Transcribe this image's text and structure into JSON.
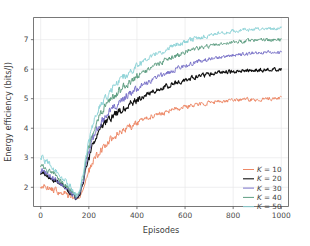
{
  "chart_data": {
    "type": "line",
    "title": "",
    "xlabel": "Episodes",
    "ylabel": "Energy efficiency (bits/J)",
    "xlim": [
      -30,
      1030
    ],
    "ylim": [
      1.35,
      7.75
    ],
    "xticks": [
      0,
      200,
      400,
      600,
      800,
      1000
    ],
    "yticks": [
      2,
      3,
      4,
      5,
      6,
      7
    ],
    "xtick_labels": [
      "0",
      "200",
      "400",
      "600",
      "800",
      "1000"
    ],
    "ytick_labels": [
      "2",
      "3",
      "4",
      "5",
      "6",
      "7"
    ],
    "grid": true,
    "grid_color": "#e8e8ea",
    "legend_position": "lower right",
    "legend_frame": false,
    "noise_amplitude": 0.055,
    "x": [
      0,
      20,
      40,
      60,
      80,
      100,
      120,
      140,
      150,
      160,
      175,
      190,
      200,
      215,
      230,
      250,
      270,
      290,
      310,
      330,
      350,
      375,
      400,
      425,
      450,
      475,
      500,
      525,
      550,
      575,
      600,
      625,
      650,
      675,
      700,
      725,
      750,
      775,
      800,
      850,
      900,
      950,
      1000
    ],
    "series": [
      {
        "name": "K = 10",
        "label_prefix": "K",
        "label_value": "10",
        "color": "#ee8866",
        "linewidth": 1.0,
        "values": [
          2.08,
          2.02,
          1.96,
          1.9,
          1.84,
          1.78,
          1.72,
          1.65,
          1.62,
          1.66,
          1.9,
          2.3,
          2.55,
          2.85,
          3.05,
          3.28,
          3.46,
          3.6,
          3.74,
          3.86,
          3.97,
          4.08,
          4.19,
          4.28,
          4.36,
          4.43,
          4.5,
          4.56,
          4.62,
          4.67,
          4.72,
          4.76,
          4.8,
          4.84,
          4.87,
          4.89,
          4.91,
          4.93,
          4.95,
          4.97,
          4.98,
          4.99,
          5.0
        ]
      },
      {
        "name": "K = 20",
        "label_prefix": "K",
        "label_value": "20",
        "color": "#101010",
        "linewidth": 1.1,
        "values": [
          2.52,
          2.42,
          2.32,
          2.22,
          2.1,
          1.97,
          1.84,
          1.7,
          1.64,
          1.72,
          2.1,
          2.7,
          3.05,
          3.45,
          3.72,
          3.98,
          4.18,
          4.34,
          4.48,
          4.6,
          4.71,
          4.84,
          4.96,
          5.07,
          5.17,
          5.26,
          5.34,
          5.42,
          5.5,
          5.57,
          5.63,
          5.69,
          5.74,
          5.79,
          5.83,
          5.86,
          5.89,
          5.91,
          5.93,
          5.95,
          5.97,
          5.98,
          5.99
        ]
      },
      {
        "name": "K = 30",
        "label_prefix": "K",
        "label_value": "30",
        "color": "#7a73c9",
        "linewidth": 1.0,
        "values": [
          2.6,
          2.5,
          2.4,
          2.28,
          2.15,
          2.01,
          1.87,
          1.72,
          1.66,
          1.76,
          2.18,
          2.82,
          3.2,
          3.62,
          3.92,
          4.2,
          4.42,
          4.6,
          4.76,
          4.9,
          5.02,
          5.18,
          5.32,
          5.45,
          5.57,
          5.68,
          5.78,
          5.87,
          5.96,
          6.04,
          6.11,
          6.18,
          6.24,
          6.29,
          6.34,
          6.38,
          6.41,
          6.44,
          6.47,
          6.51,
          6.54,
          6.56,
          6.57
        ]
      },
      {
        "name": "K = 40",
        "label_prefix": "K",
        "label_value": "40",
        "color": "#5e9e82",
        "linewidth": 1.0,
        "values": [
          2.78,
          2.66,
          2.54,
          2.4,
          2.26,
          2.1,
          1.94,
          1.78,
          1.7,
          1.82,
          2.28,
          2.96,
          3.38,
          3.84,
          4.18,
          4.5,
          4.74,
          4.94,
          5.12,
          5.28,
          5.42,
          5.59,
          5.74,
          5.88,
          6.0,
          6.12,
          6.22,
          6.32,
          6.41,
          6.49,
          6.56,
          6.63,
          6.69,
          6.74,
          6.79,
          6.83,
          6.86,
          6.89,
          6.92,
          6.95,
          6.98,
          7.0,
          7.01
        ]
      },
      {
        "name": "K = 50",
        "label_prefix": "K",
        "label_value": "50",
        "color": "#8fd4d8",
        "linewidth": 1.0,
        "values": [
          3.05,
          2.9,
          2.76,
          2.6,
          2.44,
          2.26,
          2.06,
          1.84,
          1.74,
          1.88,
          2.38,
          3.12,
          3.58,
          4.08,
          4.44,
          4.78,
          5.04,
          5.26,
          5.45,
          5.62,
          5.77,
          5.95,
          6.1,
          6.24,
          6.37,
          6.48,
          6.58,
          6.68,
          6.77,
          6.85,
          6.92,
          6.99,
          7.05,
          7.1,
          7.15,
          7.19,
          7.22,
          7.25,
          7.28,
          7.32,
          7.35,
          7.37,
          7.38
        ]
      }
    ]
  },
  "figure": {
    "background": "#ffffff",
    "plot_background": "#ffffff",
    "spine_color": "#555555"
  }
}
